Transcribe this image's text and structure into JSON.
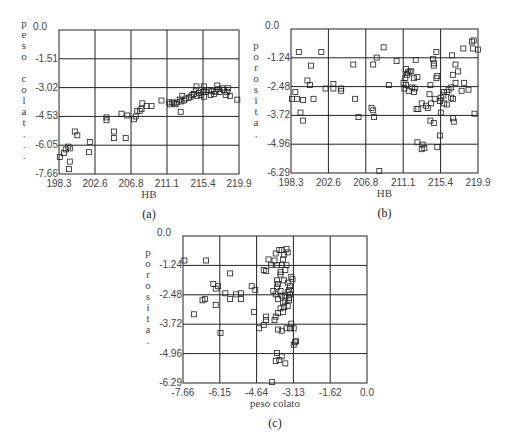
{
  "figure": {
    "captions": [
      "(a)",
      "(b)",
      "(c)"
    ]
  },
  "chart_data": [
    {
      "id": "a",
      "type": "scatter",
      "caption": "(a)",
      "xlabel": "HB",
      "ylabel": "peso colat...",
      "ylabel_chars": [
        "p",
        "e",
        "s",
        "o",
        " ",
        "c",
        "o",
        "l",
        "a",
        "t",
        ".",
        ".",
        "."
      ],
      "xticks": [
        "198.3",
        "202.6",
        "206.8",
        "211.1",
        "215.4",
        "219.9"
      ],
      "yticks": [
        "0.0",
        "-1.51",
        "-3.02",
        "-4.53",
        "-6.05",
        "-7.66"
      ],
      "xlim": [
        198.3,
        219.9
      ],
      "ylim": [
        -7.66,
        0.0
      ],
      "grid": true,
      "frame": {
        "x": 59,
        "y": 30,
        "w": 180,
        "h": 144
      },
      "points": [
        [
          198.4,
          -6.75
        ],
        [
          198.9,
          -6.55
        ],
        [
          199.1,
          -6.35
        ],
        [
          199.4,
          -6.2
        ],
        [
          199.6,
          -6.3
        ],
        [
          199.5,
          -7.4
        ],
        [
          199.6,
          -7.0
        ],
        [
          200.2,
          -5.4
        ],
        [
          200.5,
          -5.6
        ],
        [
          202.0,
          -5.95
        ],
        [
          201.9,
          -6.5
        ],
        [
          204.0,
          -4.65
        ],
        [
          204.0,
          -4.8
        ],
        [
          204.9,
          -5.4
        ],
        [
          204.9,
          -5.75
        ],
        [
          205.8,
          -4.45
        ],
        [
          206.3,
          -5.75
        ],
        [
          206.5,
          -4.55
        ],
        [
          207.3,
          -4.75
        ],
        [
          207.5,
          -4.6
        ],
        [
          207.7,
          -4.3
        ],
        [
          208.0,
          -4.3
        ],
        [
          208.2,
          -4.2
        ],
        [
          208.3,
          -3.9
        ],
        [
          208.8,
          -4.05
        ],
        [
          209.4,
          -4.05
        ],
        [
          210.6,
          -3.75
        ],
        [
          211.5,
          -3.85
        ],
        [
          211.6,
          -3.95
        ],
        [
          211.9,
          -3.85
        ],
        [
          212.1,
          -3.9
        ],
        [
          212.3,
          -3.95
        ],
        [
          212.5,
          -3.85
        ],
        [
          212.8,
          -3.7
        ],
        [
          213.0,
          -3.8
        ],
        [
          212.9,
          -4.35
        ],
        [
          213.1,
          -3.5
        ],
        [
          213.3,
          -3.75
        ],
        [
          213.5,
          -3.65
        ],
        [
          213.9,
          -3.6
        ],
        [
          214.1,
          -3.55
        ],
        [
          214.3,
          -3.45
        ],
        [
          214.5,
          -3.4
        ],
        [
          214.7,
          -3.2
        ],
        [
          214.9,
          -3.5
        ],
        [
          215.1,
          -3.35
        ],
        [
          215.3,
          -3.45
        ],
        [
          215.6,
          -3.3
        ],
        [
          215.9,
          -3.3
        ],
        [
          215.7,
          -3.55
        ],
        [
          216.0,
          -3.2
        ],
        [
          216.3,
          -3.2
        ],
        [
          216.5,
          -3.45
        ],
        [
          216.7,
          -3.25
        ],
        [
          216.9,
          -3.4
        ],
        [
          217.1,
          -3.3
        ],
        [
          217.4,
          -3.15
        ],
        [
          217.6,
          -3.3
        ],
        [
          217.9,
          -3.1
        ],
        [
          218.1,
          -3.2
        ],
        [
          218.3,
          -3.45
        ],
        [
          218.5,
          -3.3
        ],
        [
          218.6,
          -3.1
        ],
        [
          218.8,
          -3.5
        ],
        [
          219.7,
          -3.7
        ],
        [
          214.8,
          -3.0
        ],
        [
          215.7,
          -3.0
        ],
        [
          217.3,
          -2.95
        ]
      ]
    },
    {
      "id": "b",
      "type": "scatter",
      "caption": "(b)",
      "xlabel": "HB",
      "ylabel": "porosita.",
      "ylabel_chars": [
        "p",
        "o",
        "r",
        "o",
        "s",
        "i",
        "t",
        "a",
        "."
      ],
      "xticks": [
        "198.3",
        "202.6",
        "206.8",
        "211.1",
        "215.4",
        "219.9"
      ],
      "yticks": [
        "0.0",
        "-1.24",
        "-2.48",
        "-3.72",
        "-4.96",
        "-6.29"
      ],
      "xlim": [
        198.3,
        219.9
      ],
      "ylim": [
        -6.29,
        0.0
      ],
      "grid": true,
      "frame": {
        "x": 291,
        "y": 29,
        "w": 187,
        "h": 144
      },
      "points": [
        [
          199.2,
          -1.0
        ],
        [
          201.8,
          -1.0
        ],
        [
          200.6,
          -1.6
        ],
        [
          198.8,
          -2.75
        ],
        [
          198.4,
          -3.05
        ],
        [
          199.0,
          -3.05
        ],
        [
          199.7,
          -3.1
        ],
        [
          200.2,
          -2.25
        ],
        [
          200.5,
          -2.45
        ],
        [
          199.4,
          -3.65
        ],
        [
          199.7,
          -4.0
        ],
        [
          200.9,
          -3.05
        ],
        [
          202.3,
          -2.6
        ],
        [
          203.2,
          -2.4
        ],
        [
          203.2,
          -2.6
        ],
        [
          204.1,
          -2.7
        ],
        [
          204.1,
          -2.6
        ],
        [
          205.5,
          -1.55
        ],
        [
          205.7,
          -3.05
        ],
        [
          206.1,
          -3.85
        ],
        [
          207.6,
          -3.45
        ],
        [
          207.8,
          -3.55
        ],
        [
          207.9,
          -3.85
        ],
        [
          207.8,
          -1.55
        ],
        [
          208.2,
          -1.25
        ],
        [
          208.5,
          -6.2
        ],
        [
          209.0,
          -0.8
        ],
        [
          209.6,
          -2.45
        ],
        [
          210.5,
          -1.4
        ],
        [
          211.3,
          -2.35
        ],
        [
          211.5,
          -2.15
        ],
        [
          211.8,
          -1.9
        ],
        [
          211.6,
          -1.75
        ],
        [
          212.0,
          -1.85
        ],
        [
          211.7,
          -2.0
        ],
        [
          212.2,
          -1.85
        ],
        [
          211.4,
          -2.6
        ],
        [
          211.6,
          -2.45
        ],
        [
          211.9,
          -2.7
        ],
        [
          212.3,
          -2.55
        ],
        [
          212.6,
          -2.6
        ],
        [
          212.7,
          -1.35
        ],
        [
          212.5,
          -2.15
        ],
        [
          212.9,
          -2.1
        ],
        [
          212.5,
          -2.75
        ],
        [
          212.8,
          -3.5
        ],
        [
          213.0,
          -3.5
        ],
        [
          212.9,
          -4.95
        ],
        [
          213.4,
          -5.25
        ],
        [
          213.5,
          -5.05
        ],
        [
          213.7,
          -5.2
        ],
        [
          213.4,
          -3.25
        ],
        [
          213.9,
          -3.35
        ],
        [
          214.1,
          -3.45
        ],
        [
          214.3,
          -2.85
        ],
        [
          214.5,
          -3.25
        ],
        [
          214.4,
          -4.0
        ],
        [
          214.8,
          -4.1
        ],
        [
          214.9,
          -3.05
        ],
        [
          214.4,
          -2.45
        ],
        [
          214.7,
          -1.3
        ],
        [
          214.8,
          -1.5
        ],
        [
          214.8,
          -1.6
        ],
        [
          215.1,
          -2.15
        ],
        [
          215.2,
          -2.05
        ],
        [
          215.1,
          -1.0
        ],
        [
          215.5,
          -3.15
        ],
        [
          215.6,
          -3.0
        ],
        [
          215.9,
          -2.9
        ],
        [
          216.0,
          -2.75
        ],
        [
          216.3,
          -2.75
        ],
        [
          216.5,
          -2.65
        ],
        [
          216.8,
          -2.55
        ],
        [
          215.5,
          -4.65
        ],
        [
          215.2,
          -5.15
        ],
        [
          215.6,
          -3.65
        ],
        [
          216.0,
          -3.25
        ],
        [
          216.3,
          -3.3
        ],
        [
          216.8,
          -3.0
        ],
        [
          217.1,
          -4.05
        ],
        [
          217.0,
          -3.05
        ],
        [
          217.0,
          -3.9
        ],
        [
          217.3,
          -2.35
        ],
        [
          217.6,
          -1.85
        ],
        [
          217.3,
          -1.55
        ],
        [
          218.0,
          -2.7
        ],
        [
          218.3,
          -2.35
        ],
        [
          216.9,
          -1.15
        ],
        [
          218.2,
          -0.85
        ],
        [
          218.8,
          -2.65
        ],
        [
          219.2,
          -0.55
        ],
        [
          219.4,
          -0.5
        ],
        [
          219.3,
          -0.85
        ],
        [
          219.5,
          -3.7
        ],
        [
          219.9,
          -0.9
        ],
        [
          217.0,
          -2.0
        ]
      ]
    },
    {
      "id": "c",
      "type": "scatter",
      "caption": "(c)",
      "xlabel": "peso colato",
      "ylabel": "porosita.",
      "ylabel_chars": [
        "p",
        "o",
        "r",
        "o",
        "s",
        "i",
        "t",
        "a",
        "."
      ],
      "xticks": [
        "-7.66",
        "-6.15",
        "-4.64",
        "-3.13",
        "-1.62",
        "0.0"
      ],
      "yticks": [
        "0.0",
        "-1.24",
        "-2.48",
        "-3.72",
        "-4.96",
        "-6.29"
      ],
      "xlim": [
        -7.66,
        0.0
      ],
      "ylim": [
        -6.29,
        0.0
      ],
      "grid": true,
      "frame": {
        "x": 183,
        "y": 236,
        "w": 184,
        "h": 147
      },
      "points": [
        [
          -7.6,
          -1.05
        ],
        [
          -6.7,
          -1.05
        ],
        [
          -6.4,
          -2.05
        ],
        [
          -6.3,
          -2.25
        ],
        [
          -6.2,
          -2.15
        ],
        [
          -7.2,
          -3.35
        ],
        [
          -6.85,
          -2.75
        ],
        [
          -6.75,
          -2.7
        ],
        [
          -6.3,
          -2.95
        ],
        [
          -6.1,
          -4.15
        ],
        [
          -5.7,
          -1.6
        ],
        [
          -5.7,
          -2.7
        ],
        [
          -5.9,
          -2.45
        ],
        [
          -5.45,
          -2.5
        ],
        [
          -5.25,
          -2.45
        ],
        [
          -5.25,
          -2.7
        ],
        [
          -4.8,
          -2.15
        ],
        [
          -4.65,
          -2.3
        ],
        [
          -4.7,
          -3.25
        ],
        [
          -4.5,
          -3.95
        ],
        [
          -4.3,
          -3.8
        ],
        [
          -4.2,
          -3.45
        ],
        [
          -4.2,
          -3.6
        ],
        [
          -4.3,
          -1.45
        ],
        [
          -4.2,
          -1.5
        ],
        [
          -4.0,
          -1.25
        ],
        [
          -4.1,
          -1.0
        ],
        [
          -3.85,
          -1.05
        ],
        [
          -3.8,
          -0.75
        ],
        [
          -3.65,
          -0.6
        ],
        [
          -3.75,
          -1.25
        ],
        [
          -3.6,
          -1.55
        ],
        [
          -3.75,
          -1.9
        ],
        [
          -3.7,
          -2.05
        ],
        [
          -3.75,
          -2.2
        ],
        [
          -3.9,
          -2.35
        ],
        [
          -3.8,
          -2.5
        ],
        [
          -3.7,
          -2.7
        ],
        [
          -3.6,
          -2.35
        ],
        [
          -3.55,
          -2.55
        ],
        [
          -3.5,
          -2.85
        ],
        [
          -3.4,
          -2.55
        ],
        [
          -3.3,
          -2.4
        ],
        [
          -3.25,
          -2.3
        ],
        [
          -3.2,
          -2.5
        ],
        [
          -3.2,
          -2.15
        ],
        [
          -3.3,
          -2.0
        ],
        [
          -3.45,
          -1.9
        ],
        [
          -3.15,
          -1.75
        ],
        [
          -3.55,
          -1.25
        ],
        [
          -3.4,
          -1.45
        ],
        [
          -3.5,
          -1.0
        ],
        [
          -3.45,
          -0.8
        ],
        [
          -3.3,
          -0.7
        ],
        [
          -3.35,
          -0.55
        ],
        [
          -3.55,
          -0.6
        ],
        [
          -3.6,
          -3.1
        ],
        [
          -3.5,
          -3.25
        ],
        [
          -3.45,
          -3.05
        ],
        [
          -3.3,
          -3.0
        ],
        [
          -3.7,
          -3.3
        ],
        [
          -3.8,
          -3.45
        ],
        [
          -3.85,
          -3.6
        ],
        [
          -3.7,
          -4.0
        ],
        [
          -3.55,
          -4.05
        ],
        [
          -3.35,
          -3.95
        ],
        [
          -3.2,
          -3.95
        ],
        [
          -3.15,
          -3.75
        ],
        [
          -3.05,
          -3.95
        ],
        [
          -3.0,
          -4.55
        ],
        [
          -3.05,
          -4.65
        ],
        [
          -2.95,
          -4.5
        ],
        [
          -3.75,
          -5.0
        ],
        [
          -3.8,
          -5.35
        ],
        [
          -3.65,
          -5.3
        ],
        [
          -3.55,
          -5.15
        ],
        [
          -3.4,
          -5.45
        ],
        [
          -3.95,
          -6.25
        ],
        [
          -3.4,
          -2.8
        ],
        [
          -3.25,
          -2.65
        ],
        [
          -3.6,
          -1.65
        ],
        [
          -3.35,
          -1.25
        ],
        [
          -3.25,
          -2.75
        ],
        [
          -3.1,
          -1.85
        ]
      ]
    }
  ]
}
